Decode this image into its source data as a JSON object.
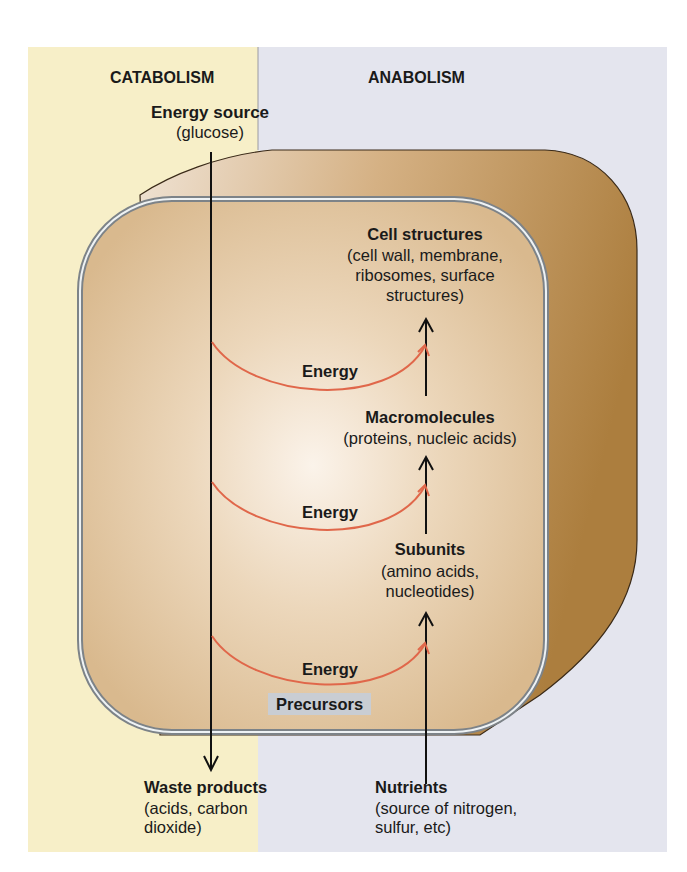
{
  "colors": {
    "catabolism_bg": "#f7efc8",
    "anabolism_bg": "#e4e5ee",
    "cell_wall": "#b98a4a",
    "cytoplasm": "#dfc097",
    "membrane": "#8d9398",
    "energy_arrow": "#e0674a",
    "flow_arrow": "#111111",
    "precursors_bg": "#c9cdd3"
  },
  "headers": {
    "catabolism": "CATABOLISM",
    "anabolism": "ANABOLISM"
  },
  "energy_source": {
    "title": "Energy source",
    "detail": "(glucose)"
  },
  "cell_structures": {
    "title": "Cell structures",
    "detail_lines": [
      "(cell wall, membrane,",
      "ribosomes, surface",
      "structures)"
    ]
  },
  "macromolecules": {
    "title": "Macromolecules",
    "detail": "(proteins, nucleic acids)"
  },
  "subunits": {
    "title": "Subunits",
    "detail_lines": [
      "(amino acids,",
      "nucleotides)"
    ]
  },
  "energy_labels": [
    "Energy",
    "Energy",
    "Energy"
  ],
  "precursors": "Precursors",
  "waste_products": {
    "title": "Waste products",
    "detail_lines": [
      "(acids, carbon",
      "dioxide)"
    ]
  },
  "nutrients": {
    "title": "Nutrients",
    "detail_lines": [
      "(source of nitrogen,",
      "sulfur, etc)"
    ]
  }
}
